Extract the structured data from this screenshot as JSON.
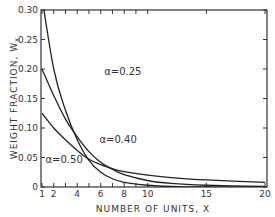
{
  "chart_data": {
    "type": "line",
    "title": "",
    "xlabel": "NUMBER OF UNITS, X",
    "ylabel": "WEIGHT FRACTION, W",
    "ylabel_subscript": "x",
    "xlim": [
      1,
      21
    ],
    "ylim": [
      0,
      0.3
    ],
    "grid": false,
    "legend": "inline annotations",
    "x_ticks": [
      1,
      2,
      4,
      6,
      8,
      10,
      15,
      20
    ],
    "x_tick_labels": [
      "1",
      "2",
      "4",
      "6",
      "8",
      "10",
      "15",
      "20"
    ],
    "y_ticks": [
      0,
      0.05,
      0.1,
      0.15,
      0.2,
      0.25,
      0.3
    ],
    "y_tick_labels": [
      "0",
      "0.05",
      "0.10",
      "0.15",
      "0.20",
      "0.25",
      "0.30"
    ],
    "x": [
      1,
      2,
      3,
      4,
      5,
      6,
      7,
      8,
      10,
      12,
      15,
      20
    ],
    "series": [
      {
        "name": "α=0.25",
        "values": [
          0.3,
          0.2,
          0.13,
          0.08,
          0.045,
          0.025,
          0.014,
          0.008,
          0.003,
          0.001,
          0.0,
          0.0
        ]
      },
      {
        "name": "α=0.40",
        "values": [
          0.2,
          0.155,
          0.115,
          0.085,
          0.06,
          0.042,
          0.03,
          0.021,
          0.011,
          0.006,
          0.003,
          0.001
        ]
      },
      {
        "name": "α=0.50",
        "values": [
          0.125,
          0.1,
          0.08,
          0.062,
          0.047,
          0.038,
          0.031,
          0.026,
          0.02,
          0.016,
          0.012,
          0.008
        ]
      }
    ],
    "annotations": [
      {
        "text": "α=0.25",
        "x": 6.3,
        "y": 0.19
      },
      {
        "text": "α=0.40",
        "x": 5.9,
        "y": 0.075
      },
      {
        "text": "α=0.50",
        "x": 1.3,
        "y": 0.04
      }
    ]
  }
}
